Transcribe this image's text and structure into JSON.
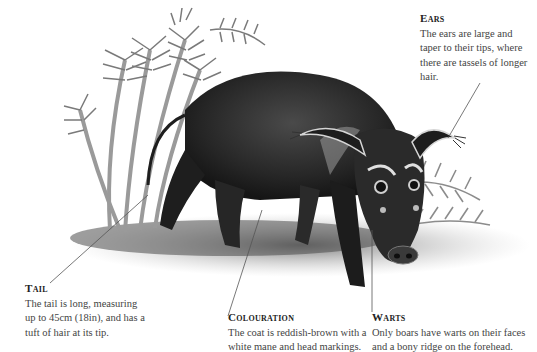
{
  "figure": {
    "palette": {
      "background": "#ffffff",
      "text": "#444444",
      "heading": "#222222",
      "leader_line": "#555555",
      "ink_dark": "#1e1e1e",
      "ink_mid": "#5a5a5a",
      "ink_light": "#a8a8a8"
    }
  },
  "callouts": {
    "ears": {
      "heading": "Ears",
      "body": "The ears are large and taper to their tips, where there are tassels of longer hair."
    },
    "tail": {
      "heading": "Tail",
      "body": "The tail is long, measuring up to 45cm (18in), and has a tuft of hair at its tip."
    },
    "colouration": {
      "heading": "Colouration",
      "body": "The coat is reddish-brown with a white mane and head markings."
    },
    "warts": {
      "heading": "Warts",
      "body": "Only boars have warts on their faces and a bony ridge on the forehead."
    }
  }
}
